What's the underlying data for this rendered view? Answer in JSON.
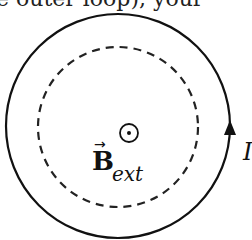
{
  "header": {
    "partial_text": "e outer loop), your"
  },
  "diagram": {
    "outer_loop": {
      "style": "solid",
      "cx": 118,
      "cy": 126,
      "r": 112,
      "color": "#111111",
      "current_direction": "counterclockwise"
    },
    "inner_loop": {
      "style": "dashed",
      "cx": 118,
      "cy": 127,
      "r": 80,
      "color": "#222222"
    },
    "field_symbol": {
      "type": "out-of-page",
      "glyph": "dot-in-circle"
    },
    "field_label": {
      "main": "B",
      "vector_arrow": "→",
      "subscript": "ext"
    },
    "current_label": "I"
  }
}
